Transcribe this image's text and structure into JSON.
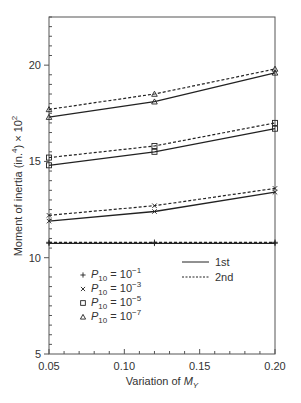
{
  "chart_data": {
    "type": "line",
    "title": "",
    "xlabel": "Variation of M_Y",
    "xlabel_parts": {
      "prefix": "Variation of ",
      "var": "M",
      "sub": "Y"
    },
    "ylabel": "Moment of inertia (in.^4) × 10^2",
    "ylabel_parts": {
      "prefix": "Moment of inertia (in.",
      "sup1": "4",
      "mid": ") × 10",
      "sup2": "2"
    },
    "xlim": [
      0.05,
      0.2
    ],
    "ylim": [
      5,
      22.5
    ],
    "xticks": [
      0.05,
      0.1,
      0.15,
      0.2
    ],
    "xtick_labels": [
      "0.05",
      "0.10",
      "0.15",
      "0.20"
    ],
    "yticks": [
      5,
      10,
      15,
      20
    ],
    "ytick_labels": [
      "5",
      "10",
      "15",
      "20"
    ],
    "grid": false,
    "x": [
      0.05,
      0.12,
      0.2
    ],
    "series": [
      {
        "name": "P10 = 10^-1, 1st",
        "marker": "plus",
        "style": "solid",
        "values": [
          10.75,
          10.75,
          10.75
        ]
      },
      {
        "name": "P10 = 10^-1, 2nd",
        "marker": "plus",
        "style": "dashed",
        "values": [
          10.8,
          10.8,
          10.8
        ]
      },
      {
        "name": "P10 = 10^-3, 1st",
        "marker": "x",
        "style": "solid",
        "values": [
          11.9,
          12.4,
          13.4
        ]
      },
      {
        "name": "P10 = 10^-3, 2nd",
        "marker": "x",
        "style": "dashed",
        "values": [
          12.2,
          12.7,
          13.6
        ]
      },
      {
        "name": "P10 = 10^-5, 1st",
        "marker": "square",
        "style": "solid",
        "values": [
          14.8,
          15.5,
          16.7
        ]
      },
      {
        "name": "P10 = 10^-5, 2nd",
        "marker": "square",
        "style": "dashed",
        "values": [
          15.2,
          15.8,
          17.0
        ]
      },
      {
        "name": "P10 = 10^-7, 1st",
        "marker": "triangle",
        "style": "solid",
        "values": [
          17.3,
          18.1,
          19.6
        ]
      },
      {
        "name": "P10 = 10^-7, 2nd",
        "marker": "triangle",
        "style": "dashed",
        "values": [
          17.7,
          18.5,
          19.8
        ]
      }
    ],
    "legend": {
      "markers": [
        {
          "marker": "plus",
          "base": "P",
          "sub": "10",
          "eq": " = 10",
          "exp": "−1"
        },
        {
          "marker": "x",
          "base": "P",
          "sub": "10",
          "eq": " = 10",
          "exp": "−3"
        },
        {
          "marker": "square",
          "base": "P",
          "sub": "10",
          "eq": " = 10",
          "exp": "−5"
        },
        {
          "marker": "triangle",
          "base": "P",
          "sub": "10",
          "eq": " = 10",
          "exp": "−7"
        }
      ],
      "lines": [
        {
          "style": "solid",
          "label": "1st"
        },
        {
          "style": "dashed",
          "label": "2nd"
        }
      ],
      "position": "lower-left inside"
    }
  },
  "colors": {
    "axis": "#555555",
    "line": "#222222"
  }
}
